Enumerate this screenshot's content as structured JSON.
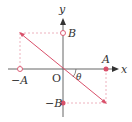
{
  "diagram": {
    "labels": {
      "x_axis": "x",
      "y_axis": "y",
      "origin": "O",
      "A": "A",
      "neg_A": "−A",
      "B": "B",
      "neg_B": "−B",
      "angle": "θ"
    },
    "colors": {
      "axis": "#555555",
      "line": "#d9506a",
      "dashed": "#e8a0ad",
      "dot": "#d9506a",
      "text": "#333333"
    }
  }
}
